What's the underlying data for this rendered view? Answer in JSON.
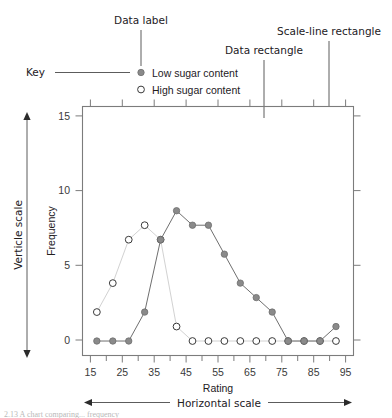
{
  "annotations": {
    "key_label": "Key",
    "data_label": "Data label",
    "data_rectangle": "Data rectangle",
    "scale_line_rectangle": "Scale-line rectangle",
    "vertical_scale": "Verticle scale",
    "horizontal_scale": "Horizontal scale"
  },
  "legend": {
    "position": "top-left-outside",
    "items": [
      {
        "label": "Low sugar content",
        "marker": "filled-circle",
        "color": "#8a8a8a"
      },
      {
        "label": "High sugar content",
        "marker": "open-circle",
        "color": "#ffffff"
      }
    ]
  },
  "caption": "2.13  A chart comparing... frequency",
  "colors": {
    "low_sugar_marker": "#8a8a8a",
    "low_sugar_line": "#6f6f6f",
    "high_sugar_marker": "#ffffff",
    "high_sugar_stroke": "#3a3a3a",
    "high_sugar_line": "#d2d2d2",
    "axis": "#7c7c7c",
    "annotation": "#23201e"
  },
  "chart_data": {
    "type": "line",
    "title": "",
    "xlabel": "Rating",
    "ylabel": "Frequency",
    "xlim": [
      12.5,
      97.5
    ],
    "ylim": [
      -1,
      16.2
    ],
    "grid": false,
    "legend_position": "top-left-outside",
    "x_ticks_major": [
      15,
      25,
      35,
      45,
      55,
      65,
      75,
      85,
      95
    ],
    "x_ticks_minor": [
      20,
      30,
      40,
      50,
      60,
      70,
      80,
      90
    ],
    "x_tick_labels": [
      "15",
      "25",
      "35",
      "45",
      "55",
      "65",
      "75",
      "85",
      "95"
    ],
    "y_ticks": [
      0,
      5,
      10,
      15
    ],
    "y_tick_labels": [
      "0",
      "5",
      "10",
      "15"
    ],
    "x": [
      17,
      22,
      27,
      32,
      37,
      42,
      47,
      52,
      57,
      62,
      67,
      72,
      77,
      82,
      87,
      92
    ],
    "series": [
      {
        "name": "Low sugar content",
        "marker": "filled-circle",
        "values": [
          0,
          0,
          0,
          2,
          7,
          9,
          8,
          8,
          6,
          4,
          3,
          2,
          0,
          0,
          0,
          1
        ]
      },
      {
        "name": "High sugar content",
        "marker": "open-circle",
        "values": [
          2,
          4,
          7,
          8,
          7,
          1,
          0,
          0,
          0,
          0,
          0,
          0,
          0,
          0,
          0,
          0
        ]
      }
    ]
  }
}
